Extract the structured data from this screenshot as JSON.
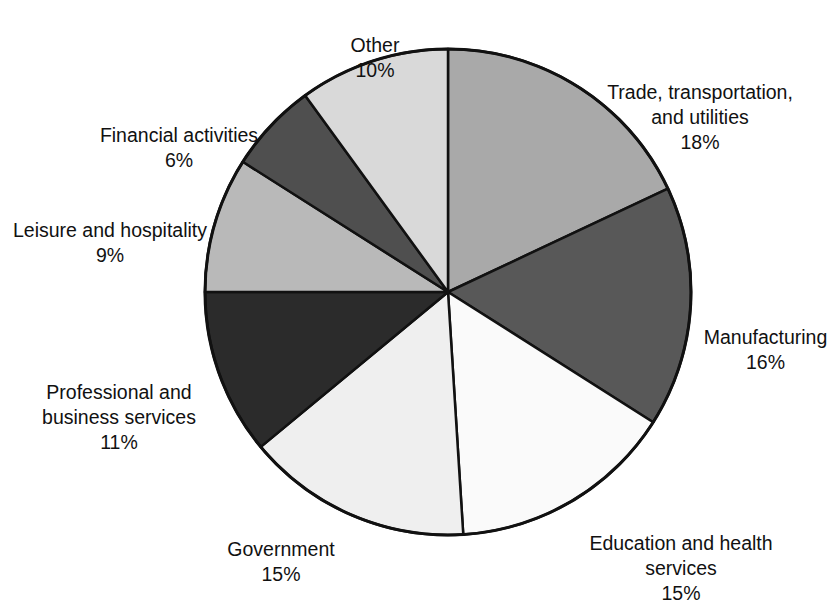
{
  "chart_data": {
    "type": "pie",
    "title": "",
    "subtitle": "",
    "xlabel": "",
    "ylabel": "",
    "legend_position": "callout-labels",
    "grid": false,
    "start_angle_deg": 0,
    "direction": "clockwise",
    "center": {
      "x": 448,
      "y": 292
    },
    "radius": 243,
    "outline_color": "#111111",
    "categories": [
      "Trade, transportation, and utilities",
      "Manufacturing",
      "Education and health services",
      "Government",
      "Professional and business services",
      "Leisure and hospitality",
      "Financial activities",
      "Other"
    ],
    "values": [
      18,
      16,
      15,
      15,
      11,
      9,
      6,
      10
    ],
    "value_labels": [
      "18%",
      "16%",
      "15%",
      "15%",
      "11%",
      "9%",
      "6%",
      "10%"
    ],
    "colors": [
      "#a9a9a9",
      "#585858",
      "#fafafa",
      "#efefef",
      "#2b2b2b",
      "#b9b9b9",
      "#4f4f4f",
      "#d9d9d9"
    ],
    "slices": [
      {
        "label": "Trade, transportation, and utilities",
        "value": 18,
        "value_label": "18%",
        "color": "#a9a9a9",
        "start_deg": 0,
        "end_deg": 64.8
      },
      {
        "label": "Manufacturing",
        "value": 16,
        "value_label": "16%",
        "color": "#585858",
        "start_deg": 64.8,
        "end_deg": 122.4
      },
      {
        "label": "Education and health services",
        "value": 15,
        "value_label": "15%",
        "color": "#fafafa",
        "start_deg": 122.4,
        "end_deg": 176.4
      },
      {
        "label": "Government",
        "value": 15,
        "value_label": "15%",
        "color": "#efefef",
        "start_deg": 176.4,
        "end_deg": 230.4
      },
      {
        "label": "Professional and business services",
        "value": 11,
        "value_label": "11%",
        "color": "#2b2b2b",
        "start_deg": 230.4,
        "end_deg": 270.0
      },
      {
        "label": "Leisure and hospitality",
        "value": 9,
        "value_label": "9%",
        "color": "#b9b9b9",
        "start_deg": 270.0,
        "end_deg": 302.4
      },
      {
        "label": "Financial activities",
        "value": 6,
        "value_label": "6%",
        "color": "#4f4f4f",
        "start_deg": 302.4,
        "end_deg": 324.0
      },
      {
        "label": "Other",
        "value": 10,
        "value_label": "10%",
        "color": "#d9d9d9",
        "start_deg": 324.0,
        "end_deg": 360.0
      }
    ]
  },
  "labels": {
    "other": {
      "name": "Other",
      "pct": "10%"
    },
    "trade": {
      "name": "Trade, transportation,\nand utilities",
      "pct": "18%"
    },
    "manufacturing": {
      "name": "Manufacturing",
      "pct": "16%"
    },
    "education": {
      "name": "Education and health\nservices",
      "pct": "15%"
    },
    "government": {
      "name": "Government",
      "pct": "15%"
    },
    "professional": {
      "name": "Professional and\nbusiness services",
      "pct": "11%"
    },
    "leisure": {
      "name": "Leisure and hospitality",
      "pct": "9%"
    },
    "financial": {
      "name": "Financial activities",
      "pct": "6%"
    }
  }
}
